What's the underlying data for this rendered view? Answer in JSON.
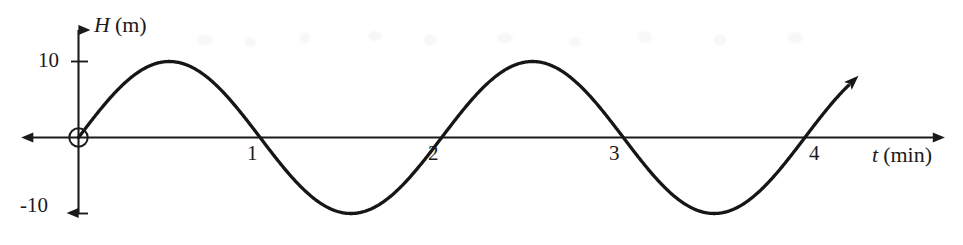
{
  "chart_data": {
    "type": "line",
    "title": "",
    "subtitle": "",
    "xlabel_variable": "t",
    "xlabel_unit": "(min)",
    "ylabel_variable": "H",
    "ylabel_unit": "(m)",
    "xlim": [
      -0.35,
      4.78
    ],
    "ylim": [
      -15.8,
      15.8
    ],
    "grid": false,
    "legend": null,
    "x_ticks": [
      1,
      2,
      3,
      4
    ],
    "x_tick_labels": [
      "1",
      "2",
      "3",
      "4"
    ],
    "y_ticks": [
      10,
      -10
    ],
    "y_tick_labels": [
      "10",
      "-10"
    ],
    "annotations": [
      {
        "name": "origin-open-circle",
        "x": 0,
        "y": 0
      },
      {
        "name": "curve-end-arrow",
        "x": 4.24,
        "y": 5.4
      }
    ],
    "series": [
      {
        "name": "H(t)",
        "equation": "H = 10 sin(pi t)",
        "amplitude": 10,
        "period": 2,
        "midline": 0,
        "color": "#161616",
        "x_start": 0,
        "x_end": 4.24,
        "x": [
          0,
          0.125,
          0.25,
          0.375,
          0.5,
          0.625,
          0.75,
          0.875,
          1,
          1.125,
          1.25,
          1.375,
          1.5,
          1.625,
          1.75,
          1.875,
          2,
          2.125,
          2.25,
          2.375,
          2.5,
          2.625,
          2.75,
          2.875,
          3,
          3.125,
          3.25,
          3.375,
          3.5,
          3.625,
          3.75,
          3.875,
          4,
          4.125,
          4.24
        ],
        "y": [
          0,
          3.83,
          7.07,
          9.24,
          10,
          9.24,
          7.07,
          3.83,
          0,
          -3.83,
          -7.07,
          -9.24,
          -10,
          -9.24,
          -7.07,
          -3.83,
          0,
          3.83,
          7.07,
          9.24,
          10,
          9.24,
          7.07,
          3.83,
          0,
          -3.83,
          -7.07,
          -9.24,
          -10,
          -9.24,
          -7.07,
          -3.83,
          0,
          3.83,
          6.9
        ],
        "key_points": [
          {
            "label": "start",
            "x": 0,
            "y": 0
          },
          {
            "label": "max",
            "x": 0.5,
            "y": 10
          },
          {
            "label": "zero",
            "x": 1,
            "y": 0
          },
          {
            "label": "min",
            "x": 1.5,
            "y": -10
          },
          {
            "label": "zero",
            "x": 2,
            "y": 0
          },
          {
            "label": "max",
            "x": 2.5,
            "y": 10
          },
          {
            "label": "zero",
            "x": 3,
            "y": 0
          },
          {
            "label": "min",
            "x": 3.5,
            "y": -10
          },
          {
            "label": "zero",
            "x": 4,
            "y": 0
          }
        ]
      }
    ],
    "axis_color": "#1b1b1b",
    "background": "#ffffff"
  },
  "figure": {
    "y_axis_label": {
      "variable": "H",
      "unit": "(m)"
    },
    "x_axis_label": {
      "variable": "t",
      "unit": "(min)"
    },
    "y_tick_top": "10",
    "y_tick_bottom": "-10",
    "x_tick_1": "1",
    "x_tick_2": "2",
    "x_tick_3": "3",
    "x_tick_4": "4"
  }
}
